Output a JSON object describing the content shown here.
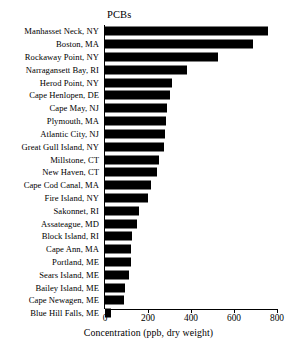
{
  "chart_data": {
    "type": "bar",
    "orientation": "horizontal",
    "title": "PCBs",
    "xlabel": "Concentration (ppb, dry weight)",
    "ylabel": "",
    "xlim": [
      0,
      800
    ],
    "xticks": [
      0,
      200,
      400,
      600,
      800
    ],
    "xtick_labels": [
      "0",
      "200",
      "400",
      "600",
      "800"
    ],
    "grid": false,
    "legend": null,
    "bar_color": "#000000",
    "background": "#ffffff",
    "categories": [
      "Manhasset Neck, NY",
      "Boston, MA",
      "Rockaway Point, NY",
      "Narragansett Bay, RI",
      "Herod Point, NY",
      "Cape Henlopen, DE",
      "Cape May, NJ",
      "Plymouth, MA",
      "Atlantic City, NJ",
      "Great Gull Island, NY",
      "Millstone, CT",
      "New Haven, CT",
      "Cape Cod Canal, MA",
      "Fire Island, NY",
      "Sakonnet, RI",
      "Assateague, MD",
      "Block Island, RI",
      "Cape Ann, MA",
      "Portland, ME",
      "Sears Island, ME",
      "Bailey Island, ME",
      "Cape Newagen, ME",
      "Blue Hill Falls, ME"
    ],
    "values": [
      760,
      690,
      525,
      380,
      310,
      300,
      290,
      285,
      280,
      275,
      250,
      240,
      215,
      200,
      160,
      150,
      125,
      120,
      120,
      110,
      95,
      90,
      30
    ]
  }
}
